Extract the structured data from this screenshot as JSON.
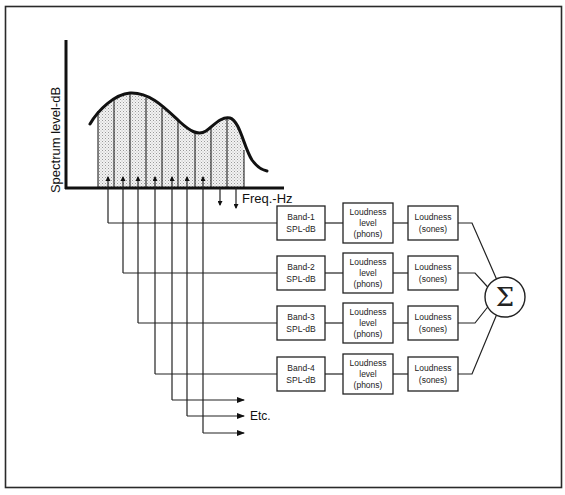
{
  "axes": {
    "y_label": "Spectrum level-dB",
    "x_label": "Freq.-Hz"
  },
  "bands": [
    {
      "band_label_1": "Band-1",
      "band_label_2": "SPL-dB",
      "level_label_1": "Loudness",
      "level_label_2": "level",
      "level_label_3": "(phons)",
      "sones_label_1": "Loudness",
      "sones_label_2": "(sones)"
    },
    {
      "band_label_1": "Band-2",
      "band_label_2": "SPL-dB",
      "level_label_1": "Loudness",
      "level_label_2": "level",
      "level_label_3": "(phons)",
      "sones_label_1": "Loudness",
      "sones_label_2": "(sones)"
    },
    {
      "band_label_1": "Band-3",
      "band_label_2": "SPL-dB",
      "level_label_1": "Loudness",
      "level_label_2": "level",
      "level_label_3": "(phons)",
      "sones_label_1": "Loudness",
      "sones_label_2": "(sones)"
    },
    {
      "band_label_1": "Band-4",
      "band_label_2": "SPL-dB",
      "level_label_1": "Loudness",
      "level_label_2": "level",
      "level_label_3": "(phons)",
      "sones_label_1": "Loudness",
      "sones_label_2": "(sones)"
    }
  ],
  "etc_label": "Etc.",
  "summation": {
    "symbol": "Σ",
    "icon": "summation-icon"
  },
  "spectrum_band_count": 9
}
